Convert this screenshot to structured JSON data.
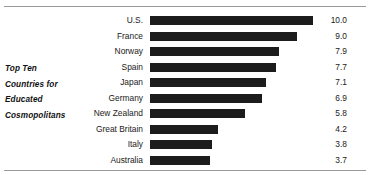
{
  "chart_data": {
    "type": "bar",
    "orientation": "horizontal",
    "title": "Top Ten Countries for Educated Cosmopolitans",
    "title_lines": [
      "Top Ten",
      "Countries for",
      "Educated",
      "Cosmopolitans"
    ],
    "xlabel": "",
    "ylabel": "",
    "grid": false,
    "legend": null,
    "xlim": [
      0,
      10
    ],
    "bar_color": "#1c1c1c",
    "background_color": "#ffffff",
    "rule_color": "#9a9a9a",
    "categories": [
      "U.S.",
      "France",
      "Norway",
      "Spain",
      "Japan",
      "Germany",
      "New Zealand",
      "Great Britain",
      "Italy",
      "Australia"
    ],
    "values": [
      10.0,
      9.0,
      7.9,
      7.7,
      7.1,
      6.9,
      5.8,
      4.2,
      3.8,
      3.7
    ],
    "value_labels": [
      "10.0",
      "9.0",
      "7.9",
      "7.7",
      "7.1",
      "6.9",
      "5.8",
      "4.2",
      "3.8",
      "3.7"
    ]
  },
  "rows": [
    {
      "label": "U.S.",
      "value": 10.0,
      "value_label": "10.0"
    },
    {
      "label": "France",
      "value": 9.0,
      "value_label": "9.0"
    },
    {
      "label": "Norway",
      "value": 7.9,
      "value_label": "7.9"
    },
    {
      "label": "Spain",
      "value": 7.7,
      "value_label": "7.7"
    },
    {
      "label": "Japan",
      "value": 7.1,
      "value_label": "7.1"
    },
    {
      "label": "Germany",
      "value": 6.9,
      "value_label": "6.9"
    },
    {
      "label": "New Zealand",
      "value": 5.8,
      "value_label": "5.8"
    },
    {
      "label": "Great Britain",
      "value": 4.2,
      "value_label": "4.2"
    },
    {
      "label": "Italy",
      "value": 3.8,
      "value_label": "3.8"
    },
    {
      "label": "Australia",
      "value": 3.7,
      "value_label": "3.7"
    }
  ],
  "caption": {
    "lines": [
      "Top Ten",
      "Countries for",
      "Educated",
      "Cosmopolitans"
    ]
  }
}
